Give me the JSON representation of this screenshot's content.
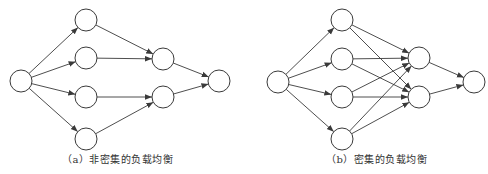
{
  "colors": {
    "stroke": "#3a3a3a",
    "node_fill": "#ffffff",
    "background": "#ffffff"
  },
  "node_radius": 11,
  "diagrams": [
    {
      "id": "a",
      "caption": "（a）非密集的负载均衡",
      "nodes": [
        {
          "id": "src",
          "x": 21,
          "y": 81
        },
        {
          "id": "l1",
          "x": 86,
          "y": 20
        },
        {
          "id": "l2",
          "x": 86,
          "y": 58
        },
        {
          "id": "l3",
          "x": 86,
          "y": 97
        },
        {
          "id": "l4",
          "x": 86,
          "y": 139
        },
        {
          "id": "m1",
          "x": 163,
          "y": 59
        },
        {
          "id": "m2",
          "x": 163,
          "y": 97
        },
        {
          "id": "dst",
          "x": 219,
          "y": 81
        }
      ],
      "edges": [
        [
          "src",
          "l1"
        ],
        [
          "src",
          "l2"
        ],
        [
          "src",
          "l3"
        ],
        [
          "src",
          "l4"
        ],
        [
          "l1",
          "m1"
        ],
        [
          "l2",
          "m1"
        ],
        [
          "l3",
          "m2"
        ],
        [
          "l4",
          "m2"
        ],
        [
          "m1",
          "dst"
        ],
        [
          "m2",
          "dst"
        ]
      ]
    },
    {
      "id": "b",
      "caption": "（b）密集的负载均衡",
      "nodes": [
        {
          "id": "src",
          "x": 278,
          "y": 82
        },
        {
          "id": "l1",
          "x": 342,
          "y": 20
        },
        {
          "id": "l2",
          "x": 342,
          "y": 59
        },
        {
          "id": "l3",
          "x": 342,
          "y": 97
        },
        {
          "id": "l4",
          "x": 342,
          "y": 139
        },
        {
          "id": "m1",
          "x": 419,
          "y": 58
        },
        {
          "id": "m2",
          "x": 419,
          "y": 97
        },
        {
          "id": "dst",
          "x": 474,
          "y": 82
        }
      ],
      "edges": [
        [
          "src",
          "l1"
        ],
        [
          "src",
          "l2"
        ],
        [
          "src",
          "l3"
        ],
        [
          "src",
          "l4"
        ],
        [
          "l1",
          "m1"
        ],
        [
          "l1",
          "m2"
        ],
        [
          "l2",
          "m1"
        ],
        [
          "l2",
          "m2"
        ],
        [
          "l3",
          "m1"
        ],
        [
          "l3",
          "m2"
        ],
        [
          "l4",
          "m1"
        ],
        [
          "l4",
          "m2"
        ],
        [
          "m1",
          "dst"
        ],
        [
          "m2",
          "dst"
        ]
      ]
    }
  ]
}
